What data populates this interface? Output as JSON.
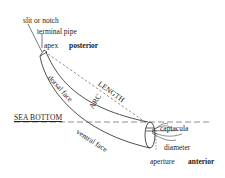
{
  "diagram": {
    "labels": {
      "slit": "slit or notch",
      "terminal_pipe": "terminal pipe",
      "apex": "apex",
      "posterior": "posterior",
      "dorsal_face": "dorsal face",
      "arc": "ARC",
      "length": "LENGTH",
      "sea_bottom": "SEA BOTTOM",
      "ventral_face": "ventral face",
      "captacula": "captacula",
      "diameter": "diameter",
      "aperture": "aperture",
      "anterior": "anterior"
    },
    "colors": {
      "line": "#222222",
      "background": "#ffffff"
    }
  }
}
